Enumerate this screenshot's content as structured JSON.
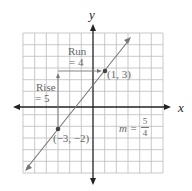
{
  "axes": {
    "x_label": "x",
    "y_label": "y"
  },
  "grid": {
    "x_range": [
      -6,
      6
    ],
    "y_range": [
      -6,
      6
    ]
  },
  "points": [
    {
      "label": "(1, 3)",
      "x": 1,
      "y": 3
    },
    {
      "label": "(−3, −2)",
      "x": -3,
      "y": -2
    }
  ],
  "annotations": {
    "run_label": "Run",
    "run_value": "= 4",
    "rise_label": "Rise",
    "rise_value": "= 5",
    "slope_prefix": "m =",
    "slope_num": "5",
    "slope_den": "4"
  },
  "colors": {
    "line": "#777777",
    "grid": "#bbbbbb",
    "axis": "#222222",
    "point": "#444444"
  }
}
